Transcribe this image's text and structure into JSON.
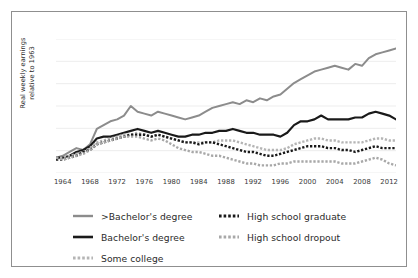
{
  "figure": {
    "ylabel": "Real weekly earnings\nrelative to 1963",
    "frame_color": "#8f8f8f",
    "background": "#ffffff"
  },
  "chart_data": {
    "type": "line",
    "title": "",
    "xlabel": "",
    "ylabel": "Real weekly earnings relative to 1963",
    "grid": true,
    "grid_axis": "y",
    "legend_position": "below",
    "xlim": [
      1963,
      2013
    ],
    "xticks": [
      1964,
      1968,
      1972,
      1976,
      1980,
      1984,
      1988,
      1992,
      1996,
      2000,
      2004,
      2008,
      2012
    ],
    "ytick_labels": [],
    "ylim": [
      0.92,
      1.62
    ],
    "colors": {
      "gt_bachelors": "#8c8c8c",
      "bachelors": "#1a1a1a",
      "some_college": "#b5b5b5",
      "hs_graduate": "#1a1a1a",
      "hs_dropout": "#a8a8a8",
      "gridline": "#ededed",
      "axis_text": "#3a3a3a"
    },
    "x": [
      1963,
      1964,
      1965,
      1966,
      1967,
      1968,
      1969,
      1970,
      1971,
      1972,
      1973,
      1974,
      1975,
      1976,
      1977,
      1978,
      1979,
      1980,
      1981,
      1982,
      1983,
      1984,
      1985,
      1986,
      1987,
      1988,
      1989,
      1990,
      1991,
      1992,
      1993,
      1994,
      1995,
      1996,
      1997,
      1998,
      1999,
      2000,
      2001,
      2002,
      2003,
      2004,
      2005,
      2006,
      2007,
      2008,
      2009,
      2010,
      2011,
      2012,
      2013
    ],
    "series": [
      {
        "name": ">Bachelor's degree",
        "key": "gt_bachelors",
        "style": "solid",
        "color": "#8c8c8c",
        "width": 2.0,
        "values": [
          1.0,
          1.01,
          1.03,
          1.05,
          1.04,
          1.07,
          1.15,
          1.17,
          1.19,
          1.2,
          1.22,
          1.27,
          1.24,
          1.23,
          1.22,
          1.24,
          1.23,
          1.22,
          1.21,
          1.2,
          1.21,
          1.22,
          1.24,
          1.26,
          1.27,
          1.28,
          1.29,
          1.28,
          1.3,
          1.29,
          1.31,
          1.3,
          1.32,
          1.33,
          1.36,
          1.39,
          1.41,
          1.43,
          1.45,
          1.46,
          1.47,
          1.48,
          1.47,
          1.46,
          1.49,
          1.48,
          1.52,
          1.54,
          1.55,
          1.56,
          1.57
        ]
      },
      {
        "name": "Bachelor's degree",
        "key": "bachelors",
        "style": "solid",
        "color": "#1a1a1a",
        "width": 2.2,
        "values": [
          1.0,
          1.0,
          1.01,
          1.03,
          1.04,
          1.06,
          1.1,
          1.11,
          1.11,
          1.12,
          1.13,
          1.14,
          1.15,
          1.14,
          1.13,
          1.14,
          1.13,
          1.12,
          1.11,
          1.11,
          1.12,
          1.12,
          1.13,
          1.13,
          1.14,
          1.14,
          1.15,
          1.14,
          1.13,
          1.13,
          1.12,
          1.12,
          1.12,
          1.11,
          1.13,
          1.17,
          1.19,
          1.19,
          1.2,
          1.22,
          1.2,
          1.2,
          1.2,
          1.2,
          1.21,
          1.21,
          1.23,
          1.24,
          1.23,
          1.22,
          1.2
        ]
      },
      {
        "name": "Some college",
        "key": "some_college",
        "style": "dotted",
        "color": "#b5b5b5",
        "width": 2.4,
        "values": [
          1.0,
          1.0,
          1.01,
          1.02,
          1.03,
          1.05,
          1.08,
          1.09,
          1.1,
          1.11,
          1.12,
          1.12,
          1.13,
          1.12,
          1.11,
          1.12,
          1.11,
          1.1,
          1.09,
          1.08,
          1.08,
          1.08,
          1.08,
          1.08,
          1.09,
          1.09,
          1.09,
          1.08,
          1.07,
          1.06,
          1.05,
          1.04,
          1.04,
          1.04,
          1.05,
          1.07,
          1.08,
          1.09,
          1.1,
          1.1,
          1.09,
          1.09,
          1.08,
          1.08,
          1.08,
          1.08,
          1.09,
          1.1,
          1.1,
          1.09,
          1.09
        ]
      },
      {
        "name": "High school graduate",
        "key": "hs_graduate",
        "style": "dotted",
        "color": "#1a1a1a",
        "width": 2.4,
        "values": [
          0.99,
          0.99,
          1.0,
          1.01,
          1.03,
          1.04,
          1.07,
          1.08,
          1.09,
          1.1,
          1.11,
          1.12,
          1.12,
          1.12,
          1.11,
          1.12,
          1.11,
          1.1,
          1.09,
          1.08,
          1.08,
          1.07,
          1.08,
          1.08,
          1.07,
          1.06,
          1.05,
          1.04,
          1.03,
          1.03,
          1.02,
          1.01,
          1.01,
          1.02,
          1.03,
          1.04,
          1.05,
          1.06,
          1.06,
          1.06,
          1.05,
          1.05,
          1.04,
          1.04,
          1.03,
          1.04,
          1.05,
          1.06,
          1.05,
          1.05,
          1.05
        ]
      },
      {
        "name": "High school dropout",
        "key": "hs_dropout",
        "style": "dotted",
        "color": "#a8a8a8",
        "width": 2.4,
        "values": [
          1.0,
          0.99,
          1.0,
          1.01,
          1.02,
          1.04,
          1.07,
          1.08,
          1.09,
          1.1,
          1.11,
          1.11,
          1.11,
          1.1,
          1.09,
          1.1,
          1.09,
          1.07,
          1.05,
          1.04,
          1.03,
          1.03,
          1.02,
          1.01,
          1.01,
          1.0,
          0.99,
          0.98,
          0.97,
          0.97,
          0.96,
          0.96,
          0.96,
          0.97,
          0.97,
          0.98,
          0.98,
          0.98,
          0.98,
          0.98,
          0.98,
          0.98,
          0.97,
          0.97,
          0.97,
          0.98,
          0.99,
          1.0,
          0.99,
          0.97,
          0.96
        ]
      }
    ]
  },
  "legend": {
    "items": [
      {
        "label": ">Bachelor's degree",
        "key": "gt_bachelors"
      },
      {
        "label": "Bachelor's degree",
        "key": "bachelors"
      },
      {
        "label": "Some college",
        "key": "some_college"
      },
      {
        "label": "High school graduate",
        "key": "hs_graduate"
      },
      {
        "label": "High school dropout",
        "key": "hs_dropout"
      }
    ]
  }
}
